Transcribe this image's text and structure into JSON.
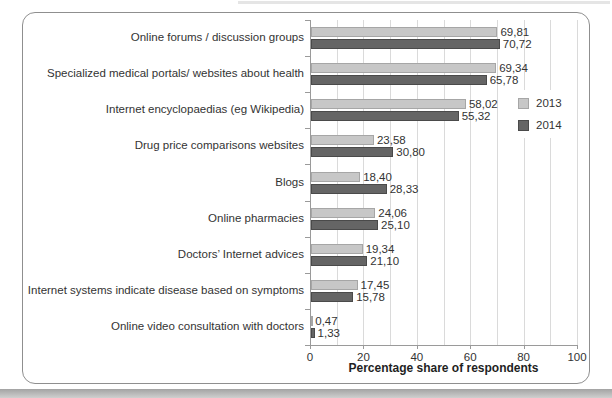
{
  "chart_data": {
    "type": "bar",
    "orientation": "horizontal",
    "title": "",
    "xlabel": "Percentage share of respondents",
    "xlim": [
      0,
      100
    ],
    "x_ticks": [
      "0",
      "20",
      "40",
      "60",
      "80",
      "100"
    ],
    "gridlines": "vertical, every 10 units, light gray",
    "legend_position": "right-inside",
    "categories": [
      "Online forums / discussion groups",
      "Specialized medical portals/ websites about health",
      "Internet encyclopaedias  (eg Wikipedia)",
      "Drug price comparisons websites",
      "Blogs",
      "Online pharmacies",
      "Doctors’ Internet advices",
      "Internet systems indicate disease based on symptoms",
      "Online video consultation with doctors"
    ],
    "series": [
      {
        "name": "2013",
        "color": "#c7c7c7",
        "border_color": "#a6a6a6",
        "values": [
          69.81,
          69.34,
          58.02,
          23.58,
          18.4,
          24.06,
          19.34,
          17.45,
          0.47
        ],
        "value_labels": [
          "69,81",
          "69,34",
          "58,02",
          "23,58",
          "18,40",
          "24,06",
          "19,34",
          "17,45",
          "0,47"
        ]
      },
      {
        "name": "2014",
        "color": "#656565",
        "border_color": "#4a4a4a",
        "values": [
          70.72,
          65.78,
          55.32,
          30.8,
          28.33,
          25.1,
          21.1,
          15.78,
          1.33
        ],
        "value_labels": [
          "70,72",
          "65,78",
          "55,32",
          "30,80",
          "28,33",
          "25,10",
          "21,10",
          "15,78",
          "1,33"
        ]
      }
    ]
  }
}
